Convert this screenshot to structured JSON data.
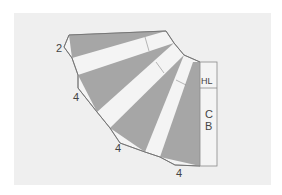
{
  "diagram": {
    "labels": {
      "top_left_dim": "2",
      "left_dim": "4",
      "bottom_left_dim": "4",
      "bottom_right_dim": "4",
      "box_top": "HL",
      "box_bottom_line1": "C",
      "box_bottom_line2": "B"
    },
    "colors": {
      "background": "#ffffff",
      "panel": "#efefef",
      "shaded": "#a6a6a6",
      "strip": "#f4f4f4",
      "outline": "#6e6e6e"
    }
  }
}
